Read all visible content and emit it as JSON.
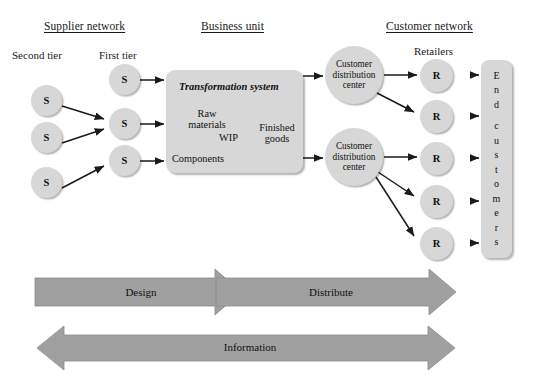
{
  "diagram": {
    "colors": {
      "node_fill": "#d7d7d7",
      "box_fill": "#d7d7d7",
      "flow_arrow_fill": "#a0a0a0",
      "line": "#1a1a1a",
      "background": "#ffffff"
    },
    "section_headers": [
      {
        "label": "Supplier network"
      },
      {
        "label": "Business unit"
      },
      {
        "label": "Customer network"
      }
    ],
    "tier_labels": [
      {
        "label": "Second tier"
      },
      {
        "label": "First tier"
      },
      {
        "label": "Retailers"
      }
    ],
    "supplier_second_tier": [
      {
        "label": "S"
      },
      {
        "label": "S"
      },
      {
        "label": "S"
      }
    ],
    "supplier_first_tier": [
      {
        "label": "S"
      },
      {
        "label": "S"
      },
      {
        "label": "S"
      }
    ],
    "transformation": {
      "title": "Transformation system",
      "inputs": [
        {
          "label": "Raw\nmaterials"
        },
        {
          "label": "Components"
        }
      ],
      "raw_materials_line1": "Raw",
      "raw_materials_line2": "materials",
      "components": "Components",
      "wip": "WIP",
      "finished_line1": "Finished",
      "finished_line2": "goods"
    },
    "distribution_centers": [
      {
        "line1": "Customer",
        "line2": "distribution",
        "line3": "center"
      },
      {
        "line1": "Customer",
        "line2": "distribution",
        "line3": "center"
      }
    ],
    "retailers": [
      {
        "label": "R"
      },
      {
        "label": "R"
      },
      {
        "label": "R"
      },
      {
        "label": "R"
      },
      {
        "label": "R"
      }
    ],
    "end_customers": {
      "full_label": "End customers",
      "letters": [
        "E",
        "n",
        "d",
        "",
        "c",
        "u",
        "s",
        "t",
        "o",
        "m",
        "e",
        "r",
        "s"
      ]
    },
    "flow_arrows": [
      {
        "label": "Design",
        "direction": "right"
      },
      {
        "label": "Distribute",
        "direction": "right"
      },
      {
        "label": "Information",
        "direction": "both"
      }
    ]
  }
}
